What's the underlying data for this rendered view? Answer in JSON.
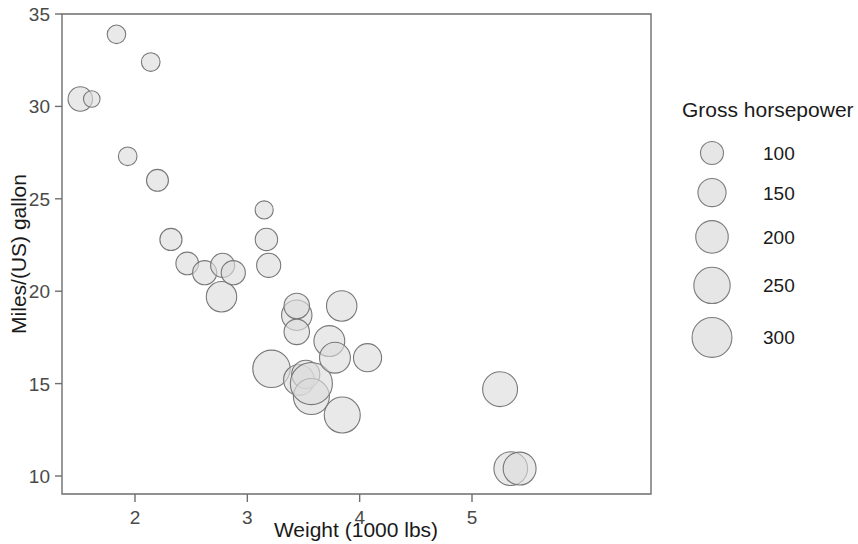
{
  "chart_data": {
    "type": "scatter",
    "subtype": "bubble",
    "title": "",
    "xlabel": "Weight (1000 lbs)",
    "ylabel": "Miles/(US) gallon",
    "xlim": [
      1.3,
      5.55
    ],
    "ylim": [
      9.2,
      35.2
    ],
    "xticks": [
      2,
      3,
      4,
      5
    ],
    "xtick_labels": [
      "2",
      "3",
      "4",
      "5"
    ],
    "yticks": [
      10,
      15,
      20,
      25,
      30,
      35
    ],
    "ytick_labels": [
      "10",
      "15",
      "20",
      "25",
      "30",
      "35"
    ],
    "grid": false,
    "size_variable": "Gross horsepower",
    "legend_position": "right",
    "series": [
      {
        "name": "cars",
        "x_name": "wt",
        "y_name": "mpg",
        "size_name": "hp",
        "points": [
          {
            "x": 1.513,
            "y": 30.4,
            "size": 113
          },
          {
            "x": 1.615,
            "y": 30.4,
            "size": 52
          },
          {
            "x": 1.835,
            "y": 33.9,
            "size": 65
          },
          {
            "x": 1.935,
            "y": 27.3,
            "size": 66
          },
          {
            "x": 2.14,
            "y": 32.4,
            "size": 66
          },
          {
            "x": 2.2,
            "y": 26.0,
            "size": 91
          },
          {
            "x": 2.32,
            "y": 22.8,
            "size": 93
          },
          {
            "x": 2.465,
            "y": 21.5,
            "size": 97
          },
          {
            "x": 2.62,
            "y": 21.0,
            "size": 110
          },
          {
            "x": 2.77,
            "y": 19.7,
            "size": 175
          },
          {
            "x": 2.78,
            "y": 21.4,
            "size": 109
          },
          {
            "x": 2.875,
            "y": 21.0,
            "size": 110
          },
          {
            "x": 3.15,
            "y": 24.4,
            "size": 62
          },
          {
            "x": 3.17,
            "y": 22.8,
            "size": 95
          },
          {
            "x": 3.19,
            "y": 21.4,
            "size": 110
          },
          {
            "x": 3.215,
            "y": 15.8,
            "size": 264
          },
          {
            "x": 3.44,
            "y": 18.7,
            "size": 175
          },
          {
            "x": 3.44,
            "y": 19.2,
            "size": 123
          },
          {
            "x": 3.44,
            "y": 17.8,
            "size": 123
          },
          {
            "x": 3.46,
            "y": 15.2,
            "size": 180
          },
          {
            "x": 3.52,
            "y": 15.5,
            "size": 150
          },
          {
            "x": 3.57,
            "y": 14.3,
            "size": 245
          },
          {
            "x": 3.57,
            "y": 15.0,
            "size": 335
          },
          {
            "x": 3.73,
            "y": 17.3,
            "size": 180
          },
          {
            "x": 3.78,
            "y": 16.4,
            "size": 180
          },
          {
            "x": 3.84,
            "y": 19.2,
            "size": 175
          },
          {
            "x": 3.845,
            "y": 13.3,
            "size": 245
          },
          {
            "x": 4.07,
            "y": 16.4,
            "size": 150
          },
          {
            "x": 5.25,
            "y": 14.7,
            "size": 230
          },
          {
            "x": 5.345,
            "y": 10.4,
            "size": 215
          },
          {
            "x": 5.424,
            "y": 10.4,
            "size": 205
          }
        ]
      }
    ],
    "legend": {
      "title": "Gross horsepower",
      "entries": [
        {
          "label": "100",
          "value": 100
        },
        {
          "label": "150",
          "value": 150
        },
        {
          "label": "200",
          "value": 200
        },
        {
          "label": "250",
          "value": 250
        },
        {
          "label": "300",
          "value": 300
        }
      ]
    },
    "colors": {
      "bubble_fill": "#dcdcdc",
      "bubble_stroke": "#787878",
      "axis": "#6e6e6e",
      "text": "#1a1a1a",
      "background": "#ffffff"
    }
  }
}
